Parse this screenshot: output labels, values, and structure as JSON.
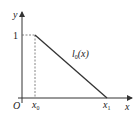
{
  "diagram": {
    "type": "function-graph",
    "axes": {
      "x_label": "x",
      "y_label": "y",
      "origin_label": "O"
    },
    "ticks": {
      "y_one": "1",
      "x0_main": "x",
      "x0_sub": "0",
      "x1_main": "x",
      "x1_sub": "1"
    },
    "curve": {
      "label_main": "l",
      "label_sub": "0",
      "label_arg": "(x)",
      "description": "Line segment from (x0, 1) to (x1, 0)"
    },
    "colors": {
      "line": "#333333",
      "dashed": "#666666",
      "text": "#222222"
    }
  }
}
